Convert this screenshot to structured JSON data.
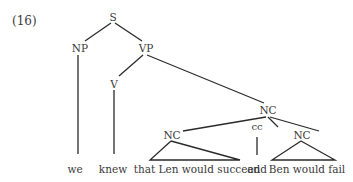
{
  "example_number": "(16)",
  "nodes": {
    "s": "S",
    "np": "NP",
    "vp": "VP",
    "v": "V",
    "nc_top": "NC",
    "nc_left": "NC",
    "cc": "cc",
    "nc_right": "NC"
  },
  "words": {
    "we": "we",
    "knew": "knew",
    "clause1": "that Len would succeed",
    "and": "and",
    "clause2": "Ben would fail"
  },
  "colors": {
    "text": "#3a3a3a",
    "lines": "#2a2a2a",
    "background": "#ffffff"
  }
}
